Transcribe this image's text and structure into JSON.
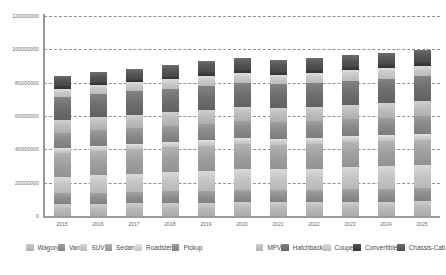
{
  "chart_data": {
    "type": "bar",
    "stacked": true,
    "title": "",
    "xlabel": "",
    "ylabel": "",
    "grid": true,
    "legend_position": "bottom",
    "ylim": [
      0,
      120000000
    ],
    "yticks": [
      0,
      20000000,
      40000000,
      60000000,
      80000000,
      100000000,
      120000000
    ],
    "ytick_labels": [
      "0",
      "20000000",
      "40000000",
      "60000000",
      "80000000",
      "100000000",
      "120000000"
    ],
    "categories": [
      "2015",
      "2016",
      "2017",
      "2018",
      "2019",
      "2020",
      "2021",
      "2022",
      "2023",
      "2024",
      "2025"
    ],
    "series": [
      {
        "name": "Wagon",
        "color": "#b9b9b9",
        "values": [
          7200000,
          7500000,
          7700000,
          7900000,
          8100000,
          8300000,
          8200000,
          8300000,
          8500000,
          8600000,
          8800000
        ]
      },
      {
        "name": "Van",
        "color": "#8f8f8f",
        "values": [
          6400000,
          6600000,
          6800000,
          7000000,
          7200000,
          7400000,
          7300000,
          7400000,
          7600000,
          7700000,
          7900000
        ]
      },
      {
        "name": "SUV",
        "color": "#c6c6c6",
        "values": [
          9800000,
          10300000,
          10800000,
          11400000,
          12000000,
          12600000,
          12500000,
          12800000,
          13200000,
          13600000,
          14000000
        ]
      },
      {
        "name": "Sedan",
        "color": "#a0a0a0",
        "values": [
          14500000,
          14700000,
          14800000,
          14900000,
          15000000,
          15100000,
          14900000,
          14800000,
          14900000,
          14900000,
          15000000
        ]
      },
      {
        "name": "Roadster",
        "color": "#d0d0d0",
        "values": [
          3100000,
          3200000,
          3300000,
          3300000,
          3400000,
          3500000,
          3400000,
          3500000,
          3600000,
          3600000,
          3700000
        ]
      },
      {
        "name": "Pickup",
        "color": "#8a8a8a",
        "values": [
          8900000,
          9100000,
          9300000,
          9500000,
          9800000,
          10000000,
          9900000,
          10100000,
          10300000,
          10500000,
          10700000
        ]
      },
      {
        "name": "MPV",
        "color": "#bdbdbd",
        "values": [
          7600000,
          7800000,
          8000000,
          8200000,
          8400000,
          8600000,
          8500000,
          8600000,
          8800000,
          8900000,
          9100000
        ]
      },
      {
        "name": "Hatchback",
        "color": "#6f6f6f",
        "values": [
          13800000,
          14000000,
          14100000,
          14200000,
          14400000,
          14500000,
          14300000,
          14300000,
          14400000,
          14500000,
          14600000
        ]
      },
      {
        "name": "Coupe",
        "color": "#c9c9c9",
        "values": [
          5200000,
          5400000,
          5500000,
          5700000,
          5900000,
          6000000,
          5900000,
          6000000,
          6200000,
          6300000,
          6500000
        ]
      },
      {
        "name": "Convertible",
        "color": "#3f3f3f",
        "values": [
          2600000,
          2700000,
          2700000,
          2800000,
          2900000,
          2900000,
          2800000,
          2900000,
          3000000,
          3000000,
          3100000
        ]
      },
      {
        "name": "Chassis-Cab",
        "color": "#595959",
        "values": [
          4900000,
          5100000,
          5300000,
          5500000,
          5700000,
          5900000,
          5800000,
          5900000,
          6100000,
          6300000,
          6500000
        ]
      }
    ],
    "totals": [
      84000000,
      86400000,
      88300000,
      90400000,
      92800000,
      94800000,
      93500000,
      94600000,
      96600000,
      97900000,
      99900000
    ]
  },
  "axis": {
    "y_max_label": "120000000",
    "y_zero_label": "0"
  },
  "legend": {
    "items": [
      {
        "label": "Wagon"
      },
      {
        "label": "Van"
      },
      {
        "label": "SUV"
      },
      {
        "label": "Sedan"
      },
      {
        "label": "Roadster"
      },
      {
        "label": "Pickup"
      },
      {
        "label": "MPV"
      },
      {
        "label": "Hatchback"
      },
      {
        "label": "Coupe"
      },
      {
        "label": "Convertible"
      },
      {
        "label": "Chassis-Cab"
      }
    ]
  },
  "style": {
    "background": "#ffffff",
    "gridline_color": "#7d7d87",
    "axis_color": "#9a9a9a",
    "tick_text_color": "#6d6d6d",
    "legend_text_color": "#4a4a4a"
  }
}
